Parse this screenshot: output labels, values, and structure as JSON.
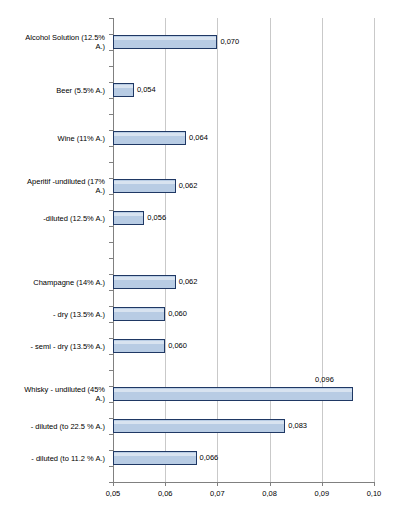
{
  "chart_data": {
    "type": "bar",
    "orientation": "horizontal",
    "title": "",
    "subtitle": "",
    "xlabel": "",
    "ylabel": "",
    "xlim": [
      0.05,
      0.1
    ],
    "xticks": [
      0.05,
      0.06,
      0.07,
      0.08,
      0.09,
      0.1
    ],
    "xtick_labels": [
      "0,05",
      "0,06",
      "0,07",
      "0,08",
      "0,09",
      "0,10"
    ],
    "decimal_separator": ",",
    "grid": "vertical",
    "legend": "none",
    "bar_fill_color": "#b8cce4",
    "bar_border_color": "#1f3864",
    "gridline_color": "#c9c9c9",
    "axis_color": "#808080",
    "background_color": "#ffffff",
    "categories": [
      "Alcohol Solution (12.5% A.)",
      "Beer (5.5% A.)",
      "Wine (11% A.)",
      "Aperitif  -undiluted (17% A.)",
      "-diluted (12.5% A.)",
      "Champagne (14% A.)",
      "- dry (13.5% A.)",
      "- semi - dry (13.5% A.)",
      "Whisky - undiluted (45% A.)",
      "- diluted (to 22.5 % A.)",
      "- diluted (to 11.2 % A.)"
    ],
    "values": [
      0.07,
      0.054,
      0.064,
      0.062,
      0.056,
      0.062,
      0.06,
      0.06,
      0.096,
      0.083,
      0.066
    ],
    "value_labels": [
      "0,070",
      "0,054",
      "0,064",
      "0,062",
      "0,056",
      "0,062",
      "0,060",
      "0,060",
      "0,096",
      "0,083",
      "0,066"
    ],
    "bars": [
      {
        "label": "Alcohol Solution (12.5% A.)",
        "label_lines": [
          "Alcohol Solution (12.5%",
          "A.)"
        ],
        "value": 0.07,
        "value_label": "0,070",
        "slot": 1,
        "label_above": false
      },
      {
        "label": "Beer (5.5% A.)",
        "label_lines": [
          "Beer (5.5% A.)"
        ],
        "value": 0.054,
        "value_label": "0,054",
        "slot": 4,
        "label_above": false
      },
      {
        "label": "Wine (11% A.)",
        "label_lines": [
          "Wine (11% A.)"
        ],
        "value": 0.064,
        "value_label": "0,064",
        "slot": 7,
        "label_above": false
      },
      {
        "label": "Aperitif  -undiluted (17% A.)",
        "label_lines": [
          "Aperitif  -undiluted (17%",
          "A.)"
        ],
        "value": 0.062,
        "value_label": "0,062",
        "slot": 10,
        "label_above": false
      },
      {
        "label": "-diluted (12.5% A.)",
        "label_lines": [
          "-diluted (12.5% A.)"
        ],
        "value": 0.056,
        "value_label": "0,056",
        "slot": 12,
        "label_above": false
      },
      {
        "label": "Champagne (14% A.)",
        "label_lines": [
          "Champagne (14% A.)"
        ],
        "value": 0.062,
        "value_label": "0,062",
        "slot": 16,
        "label_above": false
      },
      {
        "label": "- dry (13.5% A.)",
        "label_lines": [
          "- dry (13.5% A.)"
        ],
        "value": 0.06,
        "value_label": "0,060",
        "slot": 18,
        "label_above": false
      },
      {
        "label": "- semi - dry (13.5% A.)",
        "label_lines": [
          "- semi - dry (13.5% A.)"
        ],
        "value": 0.06,
        "value_label": "0,060",
        "slot": 20,
        "label_above": false
      },
      {
        "label": "Whisky - undiluted (45% A.)",
        "label_lines": [
          "Whisky - undiluted (45%",
          "A.)"
        ],
        "value": 0.096,
        "value_label": "0,096",
        "slot": 23,
        "label_above": true
      },
      {
        "label": "- diluted (to 22.5 % A.)",
        "label_lines": [
          "- diluted (to 22.5 % A.)"
        ],
        "value": 0.083,
        "value_label": "0,083",
        "slot": 25,
        "label_above": false
      },
      {
        "label": "- diluted (to 11.2 % A.)",
        "label_lines": [
          "- diluted (to 11.2 % A.)"
        ],
        "value": 0.066,
        "value_label": "0,066",
        "slot": 27,
        "label_above": false
      }
    ],
    "total_slots": 29
  }
}
